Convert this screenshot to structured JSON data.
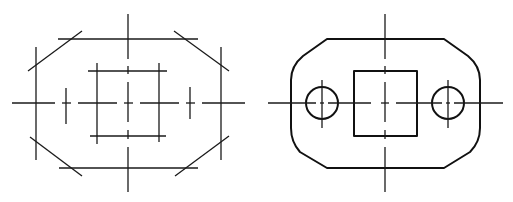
{
  "figure": {
    "title": "",
    "panels": [
      {
        "id": "construction",
        "description": "Construction lines step: outline layout with chamfer lines, centerlines and square"
      },
      {
        "id": "finished",
        "description": "Finished plate: rounded-chamfer outline, central square, two circular holes with centerlines"
      }
    ],
    "colors": {
      "line": "#1a1a1a",
      "background": "#ffffff"
    }
  }
}
